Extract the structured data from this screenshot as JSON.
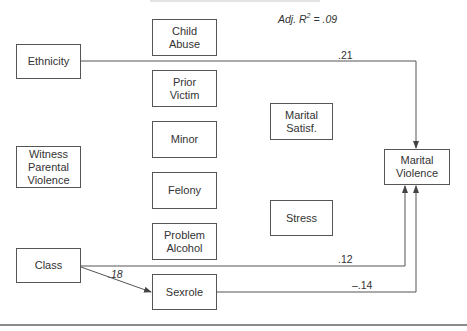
{
  "diagram": {
    "fit_statistic": {
      "prefix": "Adj. R",
      "superscript": "2",
      "suffix": " = .09"
    },
    "nodes": [
      {
        "id": "ethnicity",
        "label": "Ethnicity",
        "x": 16,
        "y": 44,
        "w": 65,
        "h": 35
      },
      {
        "id": "witness",
        "label": "Witness\nParental\nViolence",
        "x": 16,
        "y": 146,
        "w": 65,
        "h": 42
      },
      {
        "id": "class",
        "label": "Class",
        "x": 16,
        "y": 248,
        "w": 65,
        "h": 35
      },
      {
        "id": "child_abuse",
        "label": "Child\nAbuse",
        "x": 152,
        "y": 19,
        "w": 65,
        "h": 37
      },
      {
        "id": "prior_victim",
        "label": "Prior\nVictim",
        "x": 152,
        "y": 70,
        "w": 65,
        "h": 37
      },
      {
        "id": "minor",
        "label": "Minor",
        "x": 152,
        "y": 121,
        "w": 65,
        "h": 37
      },
      {
        "id": "felony",
        "label": "Felony",
        "x": 152,
        "y": 172,
        "w": 65,
        "h": 37
      },
      {
        "id": "problem_alcohol",
        "label": "Problem\nAlcohol",
        "x": 152,
        "y": 223,
        "w": 65,
        "h": 37
      },
      {
        "id": "sexrole",
        "label": "Sexrole",
        "x": 152,
        "y": 274,
        "w": 65,
        "h": 36
      },
      {
        "id": "marital_satisf",
        "label": "Marital\nSatisf.",
        "x": 270,
        "y": 103,
        "w": 63,
        "h": 37
      },
      {
        "id": "stress",
        "label": "Stress",
        "x": 270,
        "y": 200,
        "w": 63,
        "h": 36
      },
      {
        "id": "marital_violence",
        "label": "Marital\nViolence",
        "x": 384,
        "y": 149,
        "w": 66,
        "h": 36
      }
    ],
    "paths": [
      {
        "from": "ethnicity",
        "to": "marital_violence",
        "coefficient": ".21",
        "italic": false
      },
      {
        "from": "class",
        "to": "marital_violence",
        "coefficient": ".12",
        "italic": false
      },
      {
        "from": "class",
        "to": "sexrole",
        "coefficient": ".18",
        "italic": true
      },
      {
        "from": "sexrole",
        "to": "marital_violence",
        "coefficient": "–.14",
        "italic": false
      }
    ]
  }
}
